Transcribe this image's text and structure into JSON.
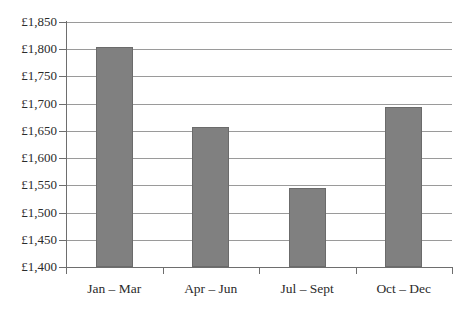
{
  "chart_data": {
    "type": "bar",
    "title": "",
    "xlabel": "",
    "ylabel": "",
    "categories": [
      "Jan – Mar",
      "Apr – Jun",
      "Jul – Sept",
      "Oct – Dec"
    ],
    "values": [
      1805,
      1658,
      1546,
      1693
    ],
    "ylim": [
      1400,
      1850
    ],
    "ytick_step": 50,
    "ytick_labels": [
      "£1,850",
      "£1,800",
      "£1,750",
      "£1,700",
      "£1,650",
      "£1,600",
      "£1,550",
      "£1,500",
      "£1,450",
      "£1,400"
    ],
    "ytick_values": [
      1850,
      1800,
      1750,
      1700,
      1650,
      1600,
      1550,
      1500,
      1450,
      1400
    ],
    "currency_symbol": "£",
    "grid": true,
    "legend": false,
    "legend_position": "none",
    "series": [
      {
        "name": "Quarterly amount",
        "values": [
          1805,
          1658,
          1546,
          1693
        ]
      }
    ],
    "bar_color": "#808080",
    "bar_border_color": "#6b6b6b",
    "gridline_color": "#9a9a9a",
    "axis_color": "#6e6e6e",
    "background_color": "#ffffff",
    "text_color": "#2b2b2b"
  },
  "clipped_title": {
    "text": ""
  }
}
